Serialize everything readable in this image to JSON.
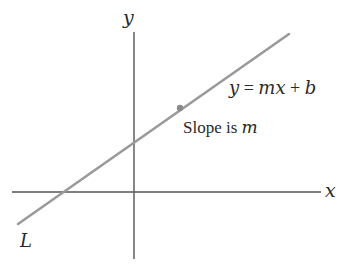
{
  "diagram": {
    "axes": {
      "x_label": "x",
      "y_label": "y",
      "color": "#555555"
    },
    "line": {
      "name": "L",
      "color": "#9a9a9a",
      "equation": "y = mx + b",
      "point_annotation": "Slope is m",
      "point_color": "#8a8a8a"
    },
    "labels": {
      "equation_y": "y",
      "equation_eq": " = ",
      "equation_mx": "mx",
      "equation_plus": " + ",
      "equation_b": "b",
      "slope_text": "Slope is ",
      "slope_var": "m",
      "line_name": "L"
    }
  }
}
